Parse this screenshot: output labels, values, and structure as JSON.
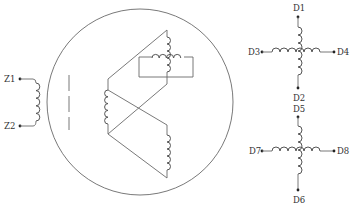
{
  "diagram": {
    "type": "winding schematic",
    "colors": {
      "line": "#6a6a6a",
      "coil": "#555555",
      "text": "#333333",
      "background": "#ffffff"
    },
    "field_winding": {
      "labels": {
        "top": "Z1",
        "bottom": "Z2"
      }
    },
    "rotor_circle": {
      "cx": 140,
      "cy": 102,
      "r": 93
    },
    "cross_winding_top": {
      "labels": {
        "top": "D1",
        "bottom": "D2",
        "left": "D3",
        "right": "D4"
      }
    },
    "cross_winding_bottom": {
      "labels": {
        "top": "D5",
        "bottom": "D6",
        "left": "D7",
        "right": "D8"
      }
    }
  }
}
